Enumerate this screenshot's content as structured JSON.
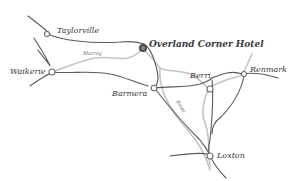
{
  "map": {
    "towns": [
      {
        "name": "Taylorville"
      },
      {
        "name": "Waikerie"
      },
      {
        "name": "Barmera"
      },
      {
        "name": "Berri"
      },
      {
        "name": "Renmark"
      },
      {
        "name": "Loxton"
      }
    ],
    "landmark": {
      "name": "Overland Corner Hotel"
    },
    "rivers": [
      {
        "name": "Murray"
      },
      {
        "name": "River"
      }
    ],
    "colors": {
      "road": "#555555",
      "river": "#bdbdbd",
      "marker": "#6e6e6e",
      "text": "#3a3a3a"
    }
  }
}
